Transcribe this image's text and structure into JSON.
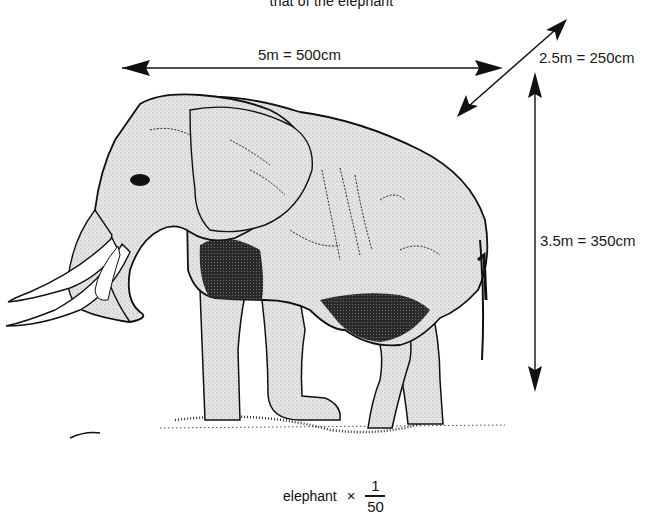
{
  "figure": {
    "caption_top": "that of the elephant",
    "subject": "elephant",
    "dimensions": {
      "length": {
        "label": "5m = 500cm",
        "meters": 5,
        "centimeters": 500,
        "orientation": "horizontal"
      },
      "width": {
        "label": "2.5m = 250cm",
        "meters": 2.5,
        "centimeters": 250,
        "orientation": "diagonal"
      },
      "height": {
        "label": "3.5m = 350cm",
        "meters": 3.5,
        "centimeters": 350,
        "orientation": "vertical"
      }
    },
    "scale": {
      "subject_label": "elephant",
      "operator": "×",
      "numerator": "1",
      "denominator": "50"
    },
    "icons": {
      "arrow": "double-headed-arrow",
      "illustration": "elephant-drawing"
    },
    "colors": {
      "ink": "#111111",
      "paper": "#ffffff",
      "hatch": "#d9d9d9"
    }
  }
}
